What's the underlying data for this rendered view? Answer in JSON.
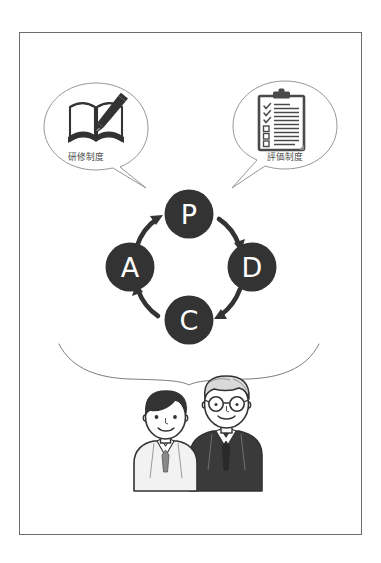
{
  "poster": {
    "background_color": "#ffffff",
    "frame_border_color": "#6d6d6d"
  },
  "colors": {
    "node_fill": "#333333",
    "node_text": "#ffffff",
    "bubble_outline": "#8a8a8a",
    "label_text": "#4a4a4a",
    "arrow": "#333333",
    "brace": "#6d6d6d",
    "icon_dark": "#333333",
    "icon_mid": "#5a5a5a",
    "skin": "#ffffff",
    "hair_young": "#333333",
    "hair_old": "#d9d9d9",
    "suit_old": "#3a3a3a",
    "suit_young": "#f2f2f2"
  },
  "bubbles": [
    {
      "id": "training",
      "label": "研修制度",
      "icon": "open-book-with-pen-icon",
      "position": "left",
      "tail_points_to": "P"
    },
    {
      "id": "evaluation",
      "label": "評価制度",
      "icon": "clipboard-checklist-icon",
      "position": "right",
      "tail_points_to": "P"
    }
  ],
  "cycle": {
    "name": "PDCA",
    "nodes": [
      {
        "id": "P",
        "letter": "P",
        "position": "top"
      },
      {
        "id": "D",
        "letter": "D",
        "position": "right"
      },
      {
        "id": "C",
        "letter": "C",
        "position": "bottom"
      },
      {
        "id": "A",
        "letter": "A",
        "position": "left"
      }
    ],
    "arrows": [
      {
        "from": "P",
        "to": "D"
      },
      {
        "from": "D",
        "to": "C"
      },
      {
        "from": "C",
        "to": "A"
      },
      {
        "from": "A",
        "to": "P"
      }
    ]
  },
  "people": [
    {
      "id": "young-employee",
      "description": "young-person-with-dark-hair",
      "hair": "dark",
      "glasses": false,
      "attire": "light-jacket-with-tie"
    },
    {
      "id": "senior-employee",
      "description": "older-person-with-gray-hair-and-glasses",
      "hair": "gray",
      "glasses": true,
      "attire": "dark-suit-with-tie"
    }
  ],
  "brace": {
    "orientation": "downward",
    "groups": "people"
  }
}
